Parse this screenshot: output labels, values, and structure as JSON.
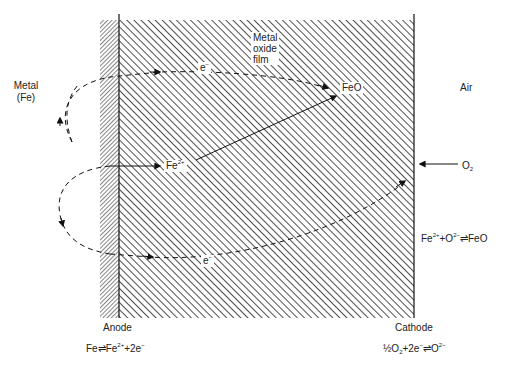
{
  "diagram": {
    "regions": {
      "metal": {
        "label_line1": "Metal",
        "label_line2": "(Fe)"
      },
      "oxide": {
        "label_line1": "Metal",
        "label_line2": "oxide",
        "label_line3": "film"
      },
      "air": {
        "label": "Air"
      }
    },
    "species": {
      "feo": "FeO",
      "fe2plus_base": "Fe",
      "fe2plus_charge": "2+",
      "electron_top_base": "e",
      "electron_top_charge": "−",
      "electron_bottom_base": "e",
      "electron_bottom_charge": "−",
      "o2_base": "O",
      "o2_sub": "2"
    },
    "reactions": {
      "oxide": {
        "p1": "Fe",
        "p1_sup": "2+",
        "p2": "+O",
        "p2_sup": "2−",
        "p3": "⇌FeO"
      },
      "anode": {
        "p1": "Fe⇌Fe",
        "p1_sup": "2+",
        "p2": "+2e",
        "p2_sup": "−"
      },
      "cathode": {
        "p1": "½O",
        "p1_sub": "2",
        "p2": "+2e",
        "p2_sup": "−",
        "p3": "⇌O",
        "p3_sup": "2−"
      }
    },
    "electrodes": {
      "anode": "Anode",
      "cathode": "Cathode"
    },
    "colors": {
      "ink": "#222222",
      "background": "#ffffff"
    }
  }
}
